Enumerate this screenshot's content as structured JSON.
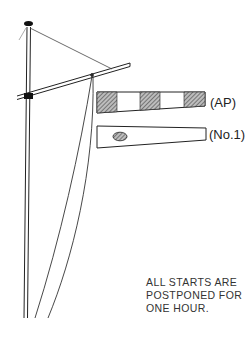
{
  "illustration": {
    "subject": "flag mast with signal flags",
    "flags": [
      {
        "id": "ap",
        "label": "(AP)",
        "pattern": "alternating hatched/white blocks"
      },
      {
        "id": "no1",
        "label": "(No.1)",
        "pattern": "white pennant with hatched oval"
      }
    ],
    "caption_lines": [
      "ALL STARTS ARE",
      "POSTPONED FOR",
      "ONE HOUR."
    ],
    "colors": {
      "ink": "#222222",
      "hatch": "#555555",
      "background": "#ffffff"
    }
  }
}
